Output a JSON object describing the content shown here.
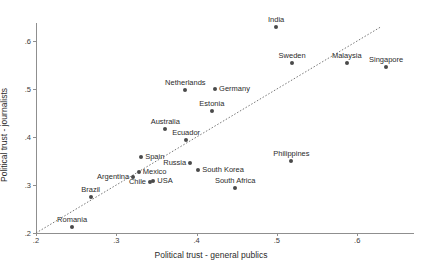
{
  "chart_data": {
    "type": "scatter",
    "title": "",
    "xlabel": "Political trust - general publics",
    "ylabel": "Political trust - journalists",
    "xlim": [
      0.2,
      0.647
    ],
    "ylim": [
      0.2,
      0.638
    ],
    "xticks": [
      ".2",
      ".3",
      ".4",
      ".5",
      ".6"
    ],
    "xtick_values": [
      0.2,
      0.3,
      0.4,
      0.5,
      0.6
    ],
    "yticks": [
      ".2",
      ".3",
      ".4",
      ".5",
      ".6"
    ],
    "ytick_values": [
      0.2,
      0.3,
      0.4,
      0.5,
      0.6
    ],
    "grid": false,
    "legend": null,
    "reference_line": {
      "type": "identity",
      "style": "dotted",
      "from": [
        0.2,
        0.2
      ],
      "to": [
        0.63,
        0.63
      ]
    },
    "points": [
      {
        "label": "India",
        "x": 0.499,
        "y": 0.629,
        "label_pos": "above"
      },
      {
        "label": "Sweden",
        "x": 0.519,
        "y": 0.554,
        "label_pos": "above"
      },
      {
        "label": "Malaysia",
        "x": 0.587,
        "y": 0.554,
        "label_pos": "above"
      },
      {
        "label": "Singapore",
        "x": 0.636,
        "y": 0.546,
        "label_pos": "above"
      },
      {
        "label": "Netherlands",
        "x": 0.386,
        "y": 0.498,
        "label_pos": "above"
      },
      {
        "label": "Germany",
        "x": 0.423,
        "y": 0.5,
        "label_pos": "right"
      },
      {
        "label": "Estonia",
        "x": 0.419,
        "y": 0.454,
        "label_pos": "above"
      },
      {
        "label": "Australia",
        "x": 0.361,
        "y": 0.417,
        "label_pos": "above"
      },
      {
        "label": "Ecuador",
        "x": 0.387,
        "y": 0.394,
        "label_pos": "above"
      },
      {
        "label": "Spain",
        "x": 0.331,
        "y": 0.358,
        "label_pos": "right"
      },
      {
        "label": "Argentina",
        "x": 0.321,
        "y": 0.317,
        "label_pos": "left"
      },
      {
        "label": "Mexico",
        "x": 0.328,
        "y": 0.327,
        "label_pos": "right"
      },
      {
        "label": "Russia",
        "x": 0.392,
        "y": 0.346,
        "label_pos": "left"
      },
      {
        "label": "South Korea",
        "x": 0.402,
        "y": 0.331,
        "label_pos": "right"
      },
      {
        "label": "Chile",
        "x": 0.342,
        "y": 0.306,
        "label_pos": "left"
      },
      {
        "label": "USA",
        "x": 0.346,
        "y": 0.308,
        "label_pos": "right"
      },
      {
        "label": "South Africa",
        "x": 0.448,
        "y": 0.294,
        "label_pos": "above"
      },
      {
        "label": "Philippines",
        "x": 0.518,
        "y": 0.35,
        "label_pos": "above"
      },
      {
        "label": "Brazil",
        "x": 0.268,
        "y": 0.275,
        "label_pos": "above"
      },
      {
        "label": "Romania",
        "x": 0.245,
        "y": 0.213,
        "label_pos": "above"
      }
    ]
  },
  "style": {
    "point_color": "#4a4a4a",
    "axis_color": "#8f8f8f",
    "text_color": "#2b2b2b",
    "background": "#ffffff"
  }
}
